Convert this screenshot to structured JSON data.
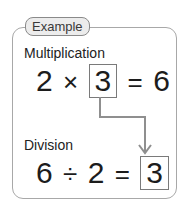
{
  "badge": {
    "label": "Example"
  },
  "multiplication": {
    "label": "Multiplication",
    "operand1": "2",
    "operator": "×",
    "answer": "3",
    "equals": "=",
    "result": "6"
  },
  "division": {
    "label": "Division",
    "operand1": "6",
    "operator": "÷",
    "operand2": "2",
    "equals": "=",
    "answer": "3"
  },
  "colors": {
    "border": "#a8a8a8",
    "connector": "#8f8f8f",
    "badge_fill": "#ececec"
  }
}
